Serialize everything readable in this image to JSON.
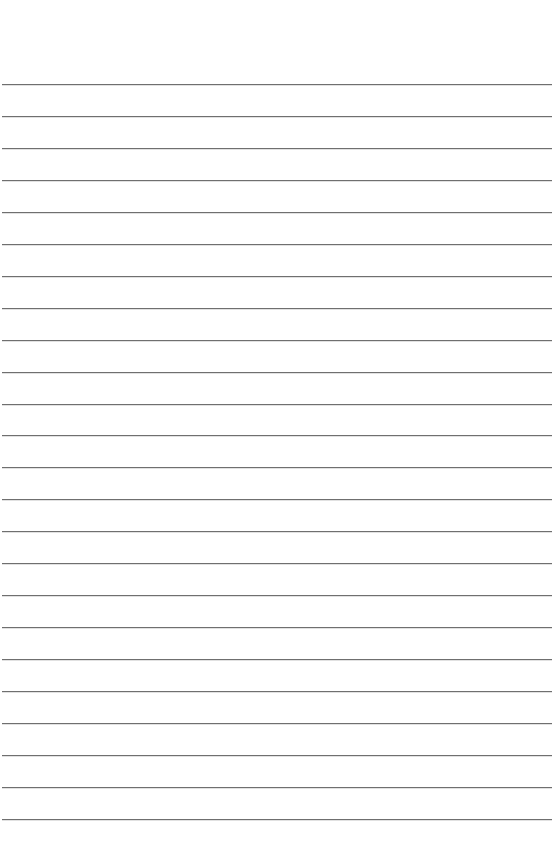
{
  "page": {
    "type": "lined-paper",
    "background_color": "#ffffff",
    "line_color": "#6f6f6f",
    "line_count": 24,
    "first_line_y": 84,
    "line_spacing": 31.95
  }
}
